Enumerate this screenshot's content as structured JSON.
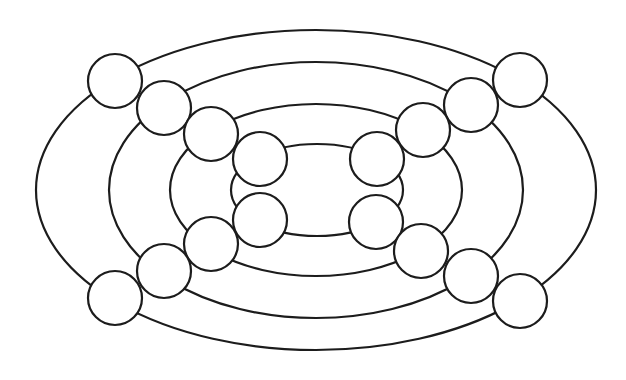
{
  "canvas": {
    "width": 626,
    "height": 380,
    "background": "#ffffff"
  },
  "style": {
    "stroke": "#1c1c1c",
    "node_fill": "#ffffff"
  },
  "rings": [
    {
      "id": "ring-1",
      "cx": 316,
      "cy": 190,
      "rx": 280,
      "ry": 160
    },
    {
      "id": "ring-2",
      "cx": 316,
      "cy": 190,
      "rx": 207,
      "ry": 128
    },
    {
      "id": "ring-3",
      "cx": 316,
      "cy": 190,
      "rx": 146,
      "ry": 86
    },
    {
      "id": "ring-4",
      "cx": 317,
      "cy": 190,
      "rx": 86,
      "ry": 46
    }
  ],
  "nodes": [
    {
      "id": "node-ring1-top-left",
      "cx": 115,
      "cy": 81,
      "r": 27
    },
    {
      "id": "node-ring2-top-left",
      "cx": 164,
      "cy": 108,
      "r": 27
    },
    {
      "id": "node-ring3-top-left",
      "cx": 211,
      "cy": 134,
      "r": 27
    },
    {
      "id": "node-ring4-top-left",
      "cx": 260,
      "cy": 159,
      "r": 27
    },
    {
      "id": "node-ring4-bottom-left",
      "cx": 260,
      "cy": 220,
      "r": 27
    },
    {
      "id": "node-ring3-bottom-left",
      "cx": 211,
      "cy": 244,
      "r": 27
    },
    {
      "id": "node-ring2-bottom-left",
      "cx": 164,
      "cy": 271,
      "r": 27
    },
    {
      "id": "node-ring1-bottom-left",
      "cx": 115,
      "cy": 298,
      "r": 27
    },
    {
      "id": "node-ring1-top-right",
      "cx": 520,
      "cy": 80,
      "r": 27
    },
    {
      "id": "node-ring2-top-right",
      "cx": 471,
      "cy": 105,
      "r": 27
    },
    {
      "id": "node-ring3-top-right",
      "cx": 423,
      "cy": 130,
      "r": 27
    },
    {
      "id": "node-ring4-top-right",
      "cx": 377,
      "cy": 159,
      "r": 27
    },
    {
      "id": "node-ring4-bottom-right",
      "cx": 376,
      "cy": 222,
      "r": 27
    },
    {
      "id": "node-ring3-bottom-right",
      "cx": 421,
      "cy": 251,
      "r": 27
    },
    {
      "id": "node-ring2-bottom-right",
      "cx": 471,
      "cy": 276,
      "r": 27
    },
    {
      "id": "node-ring1-bottom-right",
      "cx": 520,
      "cy": 301,
      "r": 27
    }
  ]
}
